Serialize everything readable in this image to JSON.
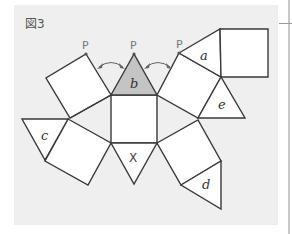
{
  "figure": {
    "title": "図3",
    "labels": {
      "a": "a",
      "b": "b",
      "c": "c",
      "d": "d",
      "e": "e",
      "x": "X",
      "p_left": "P",
      "p_center": "P",
      "p_right": "P"
    },
    "colors": {
      "panel": "#efefef",
      "shaded_face": "#c4c4c4",
      "stroke": "#3a3a3a"
    }
  }
}
